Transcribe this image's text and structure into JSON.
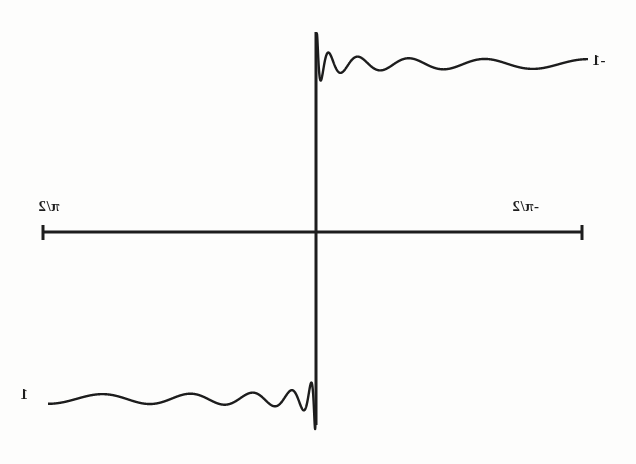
{
  "figure": {
    "kind": "line",
    "orientation": "mirrored",
    "background_color": "#fdfdfc",
    "ink_color": "#1d1d1d",
    "axes": {
      "center_x": 316,
      "center_y": 232,
      "horizontal": {
        "x_start": 42,
        "x_end": 583,
        "y": 232
      },
      "vertical": {
        "y_top": 32,
        "y_bottom": 425,
        "x": 316
      }
    },
    "labels": {
      "x_left": "π/2",
      "x_right": "-π/2",
      "y_upper": "-1",
      "y_lower": "1"
    }
  },
  "chart_data": {
    "type": "line",
    "title": "",
    "subtitle": "",
    "xlabel": "",
    "ylabel": "",
    "xlim": [
      -1.5707963,
      1.5707963
    ],
    "ylim": [
      -1.25,
      1.25
    ],
    "grid": false,
    "legend": null,
    "x_ticks": [
      -1.5707963,
      1.5707963
    ],
    "x_tick_labels": [
      "-π/2",
      "π/2"
    ],
    "y_ticks": [
      -1,
      1
    ],
    "y_tick_labels": [
      "-1",
      "1"
    ],
    "annotations": [
      {
        "text": "π/2",
        "x": 42,
        "y": 210,
        "mirrored": true
      },
      {
        "text": "-π/2",
        "x": 516,
        "y": 210,
        "mirrored": true
      },
      {
        "text": "-1",
        "x": 596,
        "y": 64,
        "mirrored": true
      },
      {
        "text": "1",
        "x": 24,
        "y": 398,
        "mirrored": true
      }
    ],
    "series": [
      {
        "name": "square wave partial sum",
        "function": "fourier_partial_sum_square_wave",
        "harmonics": 21,
        "plateau_upper_value": -1,
        "plateau_lower_value": 1,
        "plateau_upper_y_px": 64,
        "plateau_lower_y_px": 399,
        "discontinuity_x": 0,
        "gibbs_overshoot_ratio": 1.179,
        "ringing_oscillation_count": 20,
        "ringing_decay_span_px": 90
      }
    ]
  }
}
